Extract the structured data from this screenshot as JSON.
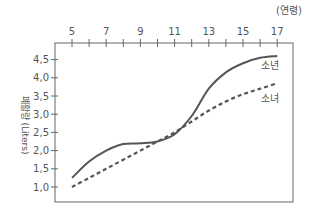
{
  "chart_data": {
    "type": "line",
    "title": "",
    "xlabel": "(연령)",
    "ylabel": "폐활량 (Liters)",
    "x_ticks": [
      "5",
      "7",
      "9",
      "11",
      "13",
      "15",
      "17"
    ],
    "y_ticks": [
      "1,0",
      "1,5",
      "2,0",
      "2,5",
      "3,0",
      "3,5",
      "4,0",
      "4,5"
    ],
    "xlim": [
      4,
      18
    ],
    "ylim": [
      0.6,
      4.9
    ],
    "grid": false,
    "legend_position": "inline-right",
    "series": [
      {
        "name": "소년",
        "style": "solid",
        "x": [
          5,
          6,
          7,
          8,
          9,
          10,
          11,
          12,
          13,
          14,
          15,
          16,
          17
        ],
        "values": [
          1.25,
          1.7,
          2.0,
          2.18,
          2.2,
          2.25,
          2.45,
          2.95,
          3.7,
          4.15,
          4.4,
          4.55,
          4.6
        ]
      },
      {
        "name": "소녀",
        "style": "dashed",
        "x": [
          5,
          6,
          7,
          8,
          9,
          10,
          11,
          12,
          13,
          14,
          15,
          16,
          17
        ],
        "values": [
          1.0,
          1.25,
          1.5,
          1.75,
          2.0,
          2.25,
          2.5,
          2.8,
          3.1,
          3.35,
          3.55,
          3.7,
          3.85
        ]
      }
    ]
  }
}
